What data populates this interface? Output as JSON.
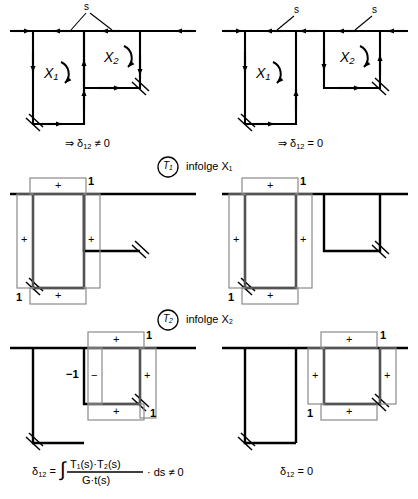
{
  "figure": {
    "type": "engineering-diagram",
    "background_color": "#ffffff",
    "line_color": "#000000",
    "overlay_color": "#8a8a8a"
  },
  "labels": {
    "s": "s",
    "X1": "X",
    "X1_sub": "1",
    "X2": "X",
    "X2_sub": "2",
    "plus": "+",
    "minus": "−",
    "one": "1",
    "minus_one": "−1",
    "T1": "T",
    "T1_sub": "1",
    "T2": "T",
    "T2_sub": "2",
    "infolge": "infolge"
  },
  "panels": {
    "top_left": {
      "name": "two-cell-shared-web",
      "caption_arrow": "⇒",
      "caption": "δ₁₂ ≠ 0",
      "caption_delta": "δ",
      "caption_delta_sub": "12",
      "caption_rel": "≠ 0",
      "s_labels": 1,
      "redundants": [
        "X₁",
        "X₂"
      ]
    },
    "top_right": {
      "name": "two-separate-cells",
      "caption_arrow": "⇒",
      "caption": "δ₁₂ = 0",
      "caption_delta": "δ",
      "caption_delta_sub": "12",
      "caption_rel": "= 0",
      "s_labels": 2,
      "redundants": [
        "X₁",
        "X₂"
      ]
    },
    "mid_left": {
      "name": "T1-diagram-shared-web",
      "signs": [
        "+",
        "+",
        "+",
        "+"
      ],
      "magnitudes": [
        "1",
        "1"
      ]
    },
    "mid_right": {
      "name": "T1-diagram-separate-cells",
      "signs": [
        "+",
        "+",
        "+",
        "+"
      ],
      "magnitudes": [
        "1",
        "1"
      ]
    },
    "bot_left": {
      "name": "T2-diagram-shared-web",
      "signs": [
        "+",
        "−",
        "+",
        "+"
      ],
      "magnitudes": [
        "1",
        "−1",
        "1"
      ]
    },
    "bot_right": {
      "name": "T2-diagram-separate-cells",
      "signs": [
        "+",
        "+",
        "+",
        "+"
      ],
      "magnitudes": [
        "1",
        "1"
      ]
    }
  },
  "dividers": {
    "T1_row": {
      "circle": "T₁",
      "text": "infolge X₁"
    },
    "T2_row": {
      "circle": "T₂",
      "text": "infolge X₂"
    }
  },
  "formulas": {
    "left": {
      "lhs_delta": "δ",
      "lhs_sub": "12",
      "eq": "=",
      "integral": "∫",
      "numerator": "T₁(s)·T₂(s)",
      "denominator": "G·t(s)",
      "tail": "· ds ≠ 0"
    },
    "right": {
      "lhs_delta": "δ",
      "lhs_sub": "12",
      "rhs": "= 0"
    }
  }
}
